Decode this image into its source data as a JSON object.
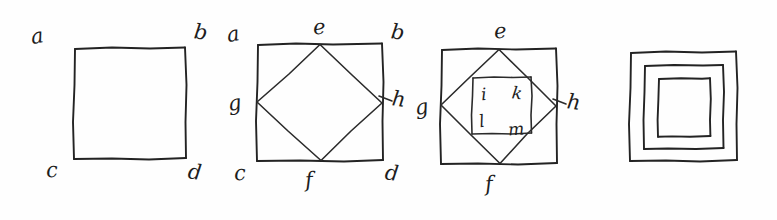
{
  "page": {
    "background_color": "#fefefe",
    "ink_color": "#232323",
    "width": 777,
    "height": 220
  },
  "figures": [
    {
      "id": "figure-1",
      "name": "plain-square",
      "description": "A single hand-drawn square with corner labels",
      "labels": [
        {
          "text": "a",
          "role": "corner-top-left"
        },
        {
          "text": "b",
          "role": "corner-top-right"
        },
        {
          "text": "c",
          "role": "corner-bottom-left"
        },
        {
          "text": "d",
          "role": "corner-bottom-right"
        }
      ]
    },
    {
      "id": "figure-2",
      "name": "square-with-inscribed-diamond",
      "description": "Square with an inscribed rotated square joining the midpoints of the sides",
      "labels": [
        {
          "text": "a",
          "role": "corner-top-left"
        },
        {
          "text": "b",
          "role": "corner-top-right"
        },
        {
          "text": "c",
          "role": "corner-bottom-left"
        },
        {
          "text": "d",
          "role": "corner-bottom-right"
        },
        {
          "text": "e",
          "role": "midpoint-top"
        },
        {
          "text": "f",
          "role": "midpoint-bottom"
        },
        {
          "text": "g",
          "role": "midpoint-left"
        },
        {
          "text": "h",
          "role": "midpoint-right"
        }
      ]
    },
    {
      "id": "figure-3",
      "name": "square-diamond-and-inner-square",
      "description": "Square with inscribed diamond plus a smaller inner square, lettered inside",
      "labels": [
        {
          "text": "e",
          "role": "midpoint-top"
        },
        {
          "text": "f",
          "role": "midpoint-bottom"
        },
        {
          "text": "g",
          "role": "midpoint-left"
        },
        {
          "text": "h",
          "role": "midpoint-right"
        },
        {
          "text": "i",
          "role": "inner-top-left"
        },
        {
          "text": "k",
          "role": "inner-top-right"
        },
        {
          "text": "l",
          "role": "inner-bottom-left"
        },
        {
          "text": "m",
          "role": "inner-bottom-right"
        }
      ]
    },
    {
      "id": "figure-4",
      "name": "three-nested-squares",
      "description": "Three concentric hand-drawn squares, unlabeled",
      "labels": []
    }
  ]
}
